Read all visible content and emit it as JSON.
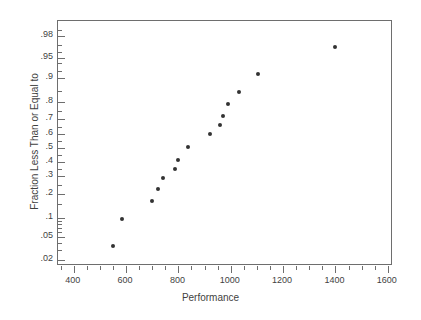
{
  "chart_data": {
    "type": "scatter",
    "title": "",
    "subtitle": "",
    "xlabel": "Performance",
    "ylabel": "Fraction Less Than or Equal to",
    "grid": false,
    "legend": null,
    "x_scale": "linear",
    "y_scale": "normal-probability",
    "xlim": [
      340,
      1620
    ],
    "ylim": [
      0.015,
      0.99
    ],
    "x_ticks": [
      400,
      600,
      800,
      1000,
      1200,
      1400,
      1600
    ],
    "x_tick_labels": [
      "400",
      "600",
      "800",
      "1000",
      "1200",
      "1400",
      "1600"
    ],
    "x_minor_tick_count_between": 3,
    "y_ticks": [
      0.02,
      0.05,
      0.1,
      0.2,
      0.3,
      0.4,
      0.5,
      0.6,
      0.7,
      0.8,
      0.9,
      0.95,
      0.98
    ],
    "y_tick_labels": [
      ".02",
      ".05",
      ".1",
      ".2",
      ".3",
      ".4",
      ".5",
      ".6",
      ".7",
      ".8",
      ".9",
      ".95",
      ".98"
    ],
    "series": [
      {
        "name": "Performance sample",
        "marker": "filled-circle",
        "color": "#333333",
        "points": [
          {
            "x": 550,
            "y": 0.035
          },
          {
            "x": 585,
            "y": 0.094
          },
          {
            "x": 700,
            "y": 0.163
          },
          {
            "x": 722,
            "y": 0.223
          },
          {
            "x": 742,
            "y": 0.288
          },
          {
            "x": 788,
            "y": 0.35
          },
          {
            "x": 800,
            "y": 0.412
          },
          {
            "x": 836,
            "y": 0.505
          },
          {
            "x": 920,
            "y": 0.6
          },
          {
            "x": 958,
            "y": 0.662
          },
          {
            "x": 972,
            "y": 0.722
          },
          {
            "x": 988,
            "y": 0.788
          },
          {
            "x": 1030,
            "y": 0.845
          },
          {
            "x": 1103,
            "y": 0.912
          },
          {
            "x": 1400,
            "y": 0.968
          }
        ]
      }
    ],
    "n_points": 15,
    "annotations": []
  },
  "axes": {
    "x_title": "Performance",
    "y_title": "Fraction Less Than or Equal to"
  }
}
